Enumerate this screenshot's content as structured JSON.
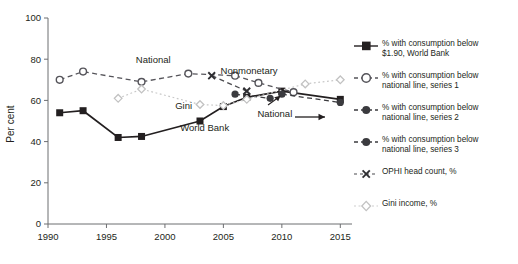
{
  "chart_data": {
    "type": "line",
    "title": "",
    "xlabel": "",
    "ylabel": "Per cent",
    "xlim": [
      1990,
      2016
    ],
    "ylim": [
      0,
      100
    ],
    "yticks": [
      0,
      20,
      40,
      60,
      80,
      100
    ],
    "xticks": [
      1990,
      1995,
      2000,
      2005,
      2010,
      2015
    ],
    "grid": false,
    "legend_position": "right",
    "series": [
      {
        "name": "% with consumption below $1.90, World Bank",
        "marker": "filled-square",
        "line": "solid",
        "color": "#231f20",
        "x": [
          1991,
          1993,
          1996,
          1998,
          2003,
          2005,
          2007,
          2010,
          2015
        ],
        "y": [
          54,
          55,
          42,
          42.5,
          50,
          57,
          61.5,
          64.5,
          60.5
        ]
      },
      {
        "name": "% with consumption below national line, series 1",
        "marker": "open-circle",
        "line": "dashed",
        "color": "#55545a",
        "x": [
          1991,
          1993,
          1998,
          2002,
          2006,
          2008,
          2011
        ],
        "y": [
          70,
          74,
          69,
          73,
          72,
          68.5,
          64
        ]
      },
      {
        "name": "% with consumption below national line, series 2",
        "marker": "filled-circle",
        "line": "dashed",
        "color": "#3b3b3f",
        "x": [
          2006,
          2009
        ],
        "y": [
          63,
          61
        ]
      },
      {
        "name": "% with consumption below national line, series 3",
        "marker": "filled-circle",
        "line": "dashed",
        "color": "#3b3b3f",
        "x": [
          2010,
          2015
        ],
        "y": [
          63,
          59
        ]
      },
      {
        "name": "OPHI head count, %",
        "marker": "x",
        "line": "dashed",
        "color": "#4a4a4e",
        "x": [
          2004,
          2007
        ],
        "y": [
          72,
          64.5
        ]
      },
      {
        "name": "Gini income, %",
        "marker": "open-diamond",
        "line": "dotted",
        "color": "#c8c8c8",
        "x": [
          1996,
          1998,
          2003,
          2005,
          2007,
          2012,
          2015
        ],
        "y": [
          61,
          65.5,
          58,
          57.5,
          60.5,
          68,
          70
        ]
      }
    ],
    "annotations": [
      {
        "text": "National",
        "x": 1999,
        "y": 78
      },
      {
        "text": "Nonmonetary",
        "x": 2007.2,
        "y": 73
      },
      {
        "text": "Gini",
        "x": 2001.6,
        "y": 56
      },
      {
        "text": "World Bank",
        "x": 2003.4,
        "y": 45
      },
      {
        "text": "National",
        "x": 2009.4,
        "y": 52
      }
    ]
  },
  "axes": {
    "ylabel": "Per cent",
    "yticks": [
      "0",
      "20",
      "40",
      "60",
      "80",
      "100"
    ],
    "xticks": [
      "1990",
      "1995",
      "2000",
      "2005",
      "2010",
      "2015"
    ]
  },
  "annotations": {
    "national_top": "National",
    "nonmonetary": "Nonmonetary",
    "gini": "Gini",
    "world_bank": "World Bank",
    "national_arrow": "National"
  },
  "legend": {
    "items": [
      {
        "line1": "% with consumption below",
        "line2": "$1.90, World Bank",
        "marker": "filled-square-solid"
      },
      {
        "line1": "% with consumption below",
        "line2": "national line, series 1",
        "marker": "open-circle-dashed"
      },
      {
        "line1": "% with consumption below",
        "line2": "national line, series 2",
        "marker": "filled-circle-dashed"
      },
      {
        "line1": "% with consumption below",
        "line2": "national line, series 3",
        "marker": "filled-circle-dashed"
      },
      {
        "line1": "OPHI head count, %",
        "line2": "",
        "marker": "x-dashed"
      },
      {
        "line1": "Gini income, %",
        "line2": "",
        "marker": "open-diamond-dotted"
      }
    ]
  }
}
